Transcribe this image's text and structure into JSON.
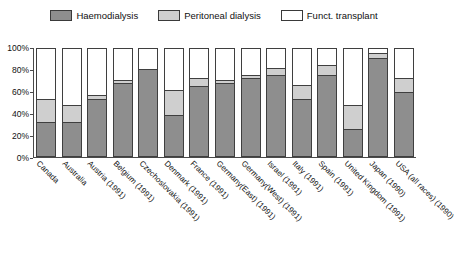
{
  "legend": {
    "items": [
      {
        "label": "Haemodialysis",
        "color": "#8e8e8e",
        "icon": "legend-swatch-haemodialysis"
      },
      {
        "label": "Peritoneal dialysis",
        "color": "#cfcfcf",
        "icon": "legend-swatch-peritoneal-dialysis"
      },
      {
        "label": "Funct. transplant",
        "color": "#ffffff",
        "icon": "legend-swatch-funct-transplant"
      }
    ]
  },
  "y_axis": {
    "ticks": [
      "0%",
      "20%",
      "40%",
      "60%",
      "80%",
      "100%"
    ]
  },
  "chart_data": {
    "type": "bar",
    "stacked": true,
    "title": "",
    "subtitle": "",
    "xlabel": "",
    "ylabel": "",
    "ylim": [
      0,
      100
    ],
    "yticks": [
      0,
      20,
      40,
      60,
      80,
      100
    ],
    "grid": false,
    "legend_position": "top",
    "categories": [
      "Canada",
      "Australia",
      "Austria (1991)",
      "Belgium (1991)",
      "Czechoslovakia (1991)",
      "Denmark (1991)",
      "France (1991)",
      "Germany(East) (1991)",
      "Germany(West) (1991)",
      "Israel (1991)",
      "Italy (1991)",
      "Spain (1991)",
      "United Kingdom (1991)",
      "Japan (1990)",
      "USA (all races) (1990)"
    ],
    "series": [
      {
        "name": "Haemodialysis",
        "color": "#8e8e8e",
        "values": [
          32,
          32,
          53,
          68,
          81,
          38,
          65,
          68,
          73,
          76,
          53,
          76,
          25,
          92,
          60
        ]
      },
      {
        "name": "Peritoneal dialysis",
        "color": "#cfcfcf",
        "values": [
          21,
          16,
          4,
          3,
          0,
          24,
          8,
          3,
          3,
          6,
          13,
          9,
          23,
          4,
          13
        ]
      },
      {
        "name": "Funct. transplant",
        "color": "#ffffff",
        "values": [
          47,
          52,
          43,
          29,
          19,
          38,
          27,
          29,
          24,
          18,
          34,
          15,
          52,
          4,
          27
        ]
      }
    ]
  }
}
